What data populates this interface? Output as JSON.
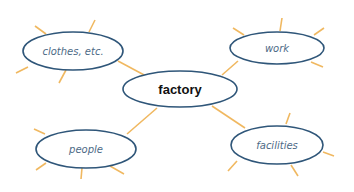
{
  "diagram": {
    "type": "mind-map",
    "colors": {
      "ellipse_stroke": "#2f5679",
      "connector": "#f0b860",
      "center_text": "#111111",
      "child_text": "#4d6a86"
    },
    "center": {
      "label": "factory",
      "cx": 180,
      "cy": 89,
      "rx": 57,
      "ry": 18
    },
    "nodes": [
      {
        "label": "clothes, etc.",
        "cx": 73,
        "cy": 51,
        "rx": 50,
        "ry": 19
      },
      {
        "label": "work",
        "cx": 277,
        "cy": 48,
        "rx": 47,
        "ry": 16
      },
      {
        "label": "people",
        "cx": 86,
        "cy": 149,
        "rx": 50,
        "ry": 19
      },
      {
        "label": "facilities",
        "cx": 277,
        "cy": 145,
        "rx": 46,
        "ry": 19
      }
    ]
  }
}
